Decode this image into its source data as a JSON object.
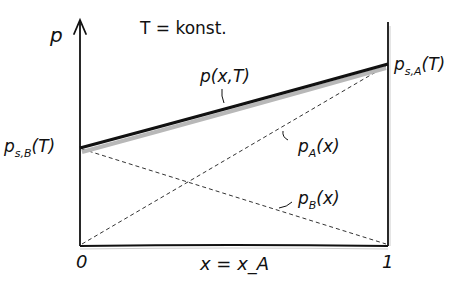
{
  "title": "T = konst.",
  "axes": {
    "y_label": "p",
    "x_label": "x = x_A",
    "x_min_label": "0",
    "x_max_label": "1"
  },
  "points": {
    "left": {
      "label_main": "p",
      "label_sub": "s,B",
      "label_tail": "(T)"
    },
    "right": {
      "label_main": "p",
      "label_sub": "s,A",
      "label_tail": "(T)"
    }
  },
  "curves": {
    "total": {
      "label": "p(x,T)",
      "style": "solid-thick"
    },
    "partial_A": {
      "label_main": "p",
      "label_sub": "A",
      "label_tail": "(x)",
      "style": "dashed"
    },
    "partial_B": {
      "label_main": "p",
      "label_sub": "B",
      "label_tail": "(x)",
      "style": "dashed"
    }
  },
  "colors": {
    "ink": "#111111",
    "shadow": "#b8b8b8",
    "background": "#ffffff"
  }
}
